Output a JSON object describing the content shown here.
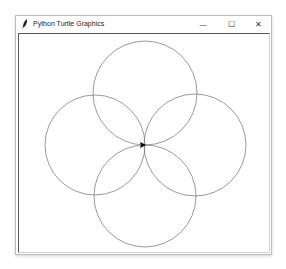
{
  "window": {
    "title": "Python Turtle Graphics",
    "app_icon": "feather-icon",
    "controls": {
      "minimize": "—",
      "maximize": "☐",
      "close": "✕"
    }
  },
  "canvas": {
    "background": "#ffffff",
    "stroke_color": "#808080",
    "circles": [
      {
        "name": "top",
        "cx": 145,
        "cy": 93,
        "r": 52
      },
      {
        "name": "left",
        "cx": 95,
        "cy": 145,
        "r": 50
      },
      {
        "name": "right",
        "cx": 195,
        "cy": 145,
        "r": 51
      },
      {
        "name": "bottom",
        "cx": 145,
        "cy": 196,
        "r": 51
      }
    ],
    "turtle": {
      "x": 143,
      "y": 145,
      "heading": "east",
      "color": "#000000"
    }
  }
}
